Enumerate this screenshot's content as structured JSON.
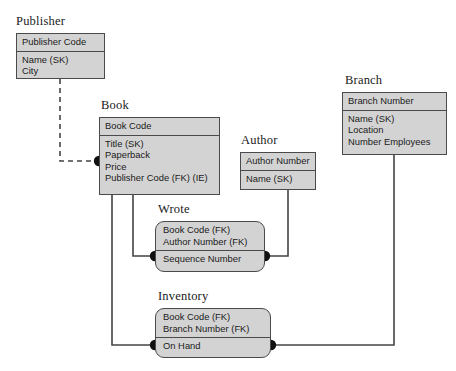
{
  "diagram": {
    "style": {
      "entity_fill": "#d3d3d3",
      "entity_border": "#4a4a4a",
      "line_color": "#444444",
      "background": "#ffffff",
      "dot_color": "#111111"
    }
  },
  "entities": [
    {
      "id": "publisher",
      "name": "Publisher",
      "shape": "rectangle",
      "x": 16,
      "y": 33,
      "w": 89,
      "h": 46,
      "label_x": 16,
      "label_y": 14,
      "key_fields": [
        "Publisher Code"
      ],
      "attributes": [
        "Name (SK)",
        "City"
      ]
    },
    {
      "id": "book",
      "name": "Book",
      "shape": "rectangle",
      "x": 99,
      "y": 117,
      "w": 121,
      "h": 78,
      "label_x": 101,
      "label_y": 98,
      "key_fields": [
        "Book Code"
      ],
      "attributes": [
        "Title (SK)",
        "Paperback",
        "Price",
        "Publisher Code (FK) (IE)"
      ]
    },
    {
      "id": "author",
      "name": "Author",
      "shape": "rectangle",
      "x": 240,
      "y": 152,
      "w": 76,
      "h": 38,
      "label_x": 241,
      "label_y": 133,
      "key_fields": [
        "Author Number"
      ],
      "attributes": [
        "Name (SK)"
      ]
    },
    {
      "id": "branch",
      "name": "Branch",
      "shape": "rectangle",
      "x": 342,
      "y": 92,
      "w": 105,
      "h": 63,
      "label_x": 345,
      "label_y": 73,
      "key_fields": [
        "Branch Number"
      ],
      "attributes": [
        "Name (SK)",
        "Location",
        "Number Employees"
      ]
    },
    {
      "id": "wrote",
      "name": "Wrote",
      "shape": "rounded-rectangle",
      "x": 155,
      "y": 221,
      "w": 110,
      "h": 51,
      "label_x": 158,
      "label_y": 202,
      "key_fields": [
        "Book Code (FK)",
        "Author Number (FK)"
      ],
      "attributes": [
        "Sequence Number"
      ]
    },
    {
      "id": "inventory",
      "name": "Inventory",
      "shape": "rounded-rectangle",
      "x": 155,
      "y": 308,
      "w": 116,
      "h": 50,
      "label_x": 158,
      "label_y": 289,
      "key_fields": [
        "Book Code (FK)",
        "Branch Number (FK)"
      ],
      "attributes": [
        "On Hand"
      ]
    }
  ],
  "relationships": [
    {
      "id": "publisher-book",
      "from": "publisher",
      "to": "book",
      "line_style": "dashed",
      "path": "M 60 79 L 60 161 L 99 161",
      "endpoint_dot": {
        "x": 99,
        "y": 161
      }
    },
    {
      "id": "book-wrote",
      "from": "book",
      "to": "wrote",
      "line_style": "solid",
      "path": "M 133 195 L 133 256 L 155 256",
      "endpoint_dot": {
        "x": 155,
        "y": 256
      }
    },
    {
      "id": "author-wrote",
      "from": "author",
      "to": "wrote",
      "line_style": "solid",
      "path": "M 288 190 L 288 256 L 265 256",
      "endpoint_dot": {
        "x": 265,
        "y": 256
      }
    },
    {
      "id": "book-inventory",
      "from": "book",
      "to": "inventory",
      "line_style": "solid",
      "path": "M 112 195 L 112 345 L 155 345",
      "endpoint_dot": {
        "x": 155,
        "y": 345
      }
    },
    {
      "id": "branch-inventory",
      "from": "branch",
      "to": "inventory",
      "line_style": "solid",
      "path": "M 394 155 L 394 345 L 271 345",
      "endpoint_dot": {
        "x": 271,
        "y": 345
      }
    }
  ]
}
